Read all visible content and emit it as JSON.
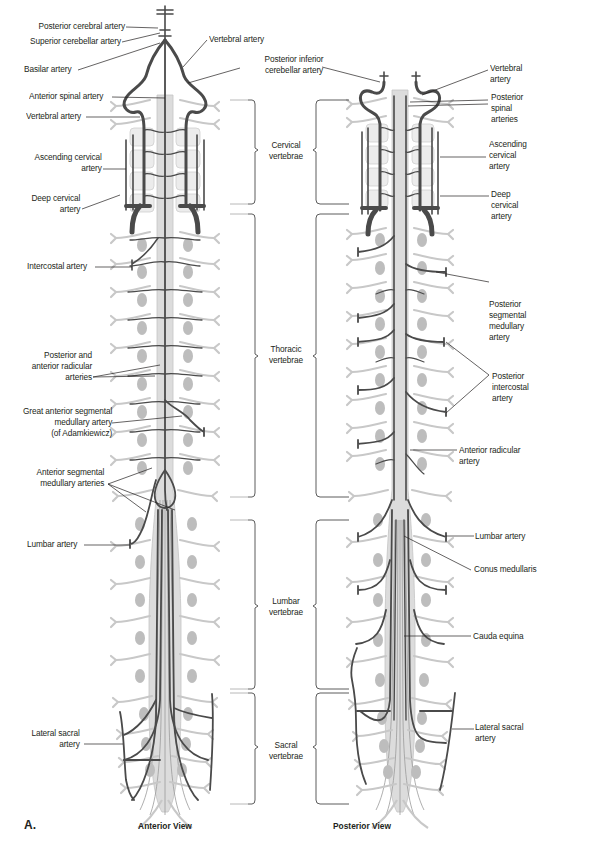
{
  "figure": {
    "panel_letter": "A.",
    "views": {
      "anterior": "Anterior View",
      "posterior": "Posterior View"
    },
    "regions": {
      "cervical": [
        "Cervical",
        "vertebrae"
      ],
      "thoracic": [
        "Thoracic",
        "vertebrae"
      ],
      "lumbar": [
        "Lumbar",
        "vertebrae"
      ],
      "sacral": [
        "Sacral",
        "vertebrae"
      ]
    },
    "anterior_labels": {
      "posterior_cerebral": "Posterior cerebral artery",
      "superior_cerebellar": "Superior cerebellar artery",
      "basilar": "Basilar artery",
      "vertebral_top": "Vertebral artery",
      "pica": [
        "Posterior inferior",
        "cerebellar artery"
      ],
      "anterior_spinal": "Anterior spinal artery",
      "vertebral": "Vertebral artery",
      "ascending_cervical": [
        "Ascending cervical",
        "artery"
      ],
      "deep_cervical": [
        "Deep cervical",
        "artery"
      ],
      "intercostal": "Intercostal artery",
      "radicular": [
        "Posterior and",
        "anterior radicular",
        "arteries"
      ],
      "adamkiewicz": [
        "Great anterior segmental",
        "medullary artery",
        "(of Adamkiewicz)"
      ],
      "ant_segmental": [
        "Anterior segmental",
        "medullary arteries"
      ],
      "lumbar": "Lumbar artery",
      "lateral_sacral": [
        "Lateral sacral",
        "artery"
      ]
    },
    "posterior_labels": {
      "vertebral": [
        "Vertebral",
        "artery"
      ],
      "posterior_spinal": [
        "Posterior",
        "spinal",
        "arteries"
      ],
      "ascending_cervical": [
        "Ascending",
        "cervical",
        "artery"
      ],
      "deep_cervical": [
        "Deep",
        "cervical",
        "artery"
      ],
      "post_segmental": [
        "Posterior",
        "segmental",
        "medullary",
        "artery"
      ],
      "post_intercostal": [
        "Posterior",
        "intercostal",
        "artery"
      ],
      "ant_radicular": [
        "Anterior radicular",
        "artery"
      ],
      "lumbar": "Lumbar artery",
      "conus": "Conus medullaris",
      "cauda": "Cauda equina",
      "lateral_sacral": [
        "Lateral sacral",
        "artery"
      ]
    },
    "colors": {
      "artery": "#4a4a4a",
      "cord": "#d9d9d9",
      "nerve": "#c8c8c8",
      "vertebral_body": "#bdbdbd",
      "leader": "#231f20"
    }
  }
}
